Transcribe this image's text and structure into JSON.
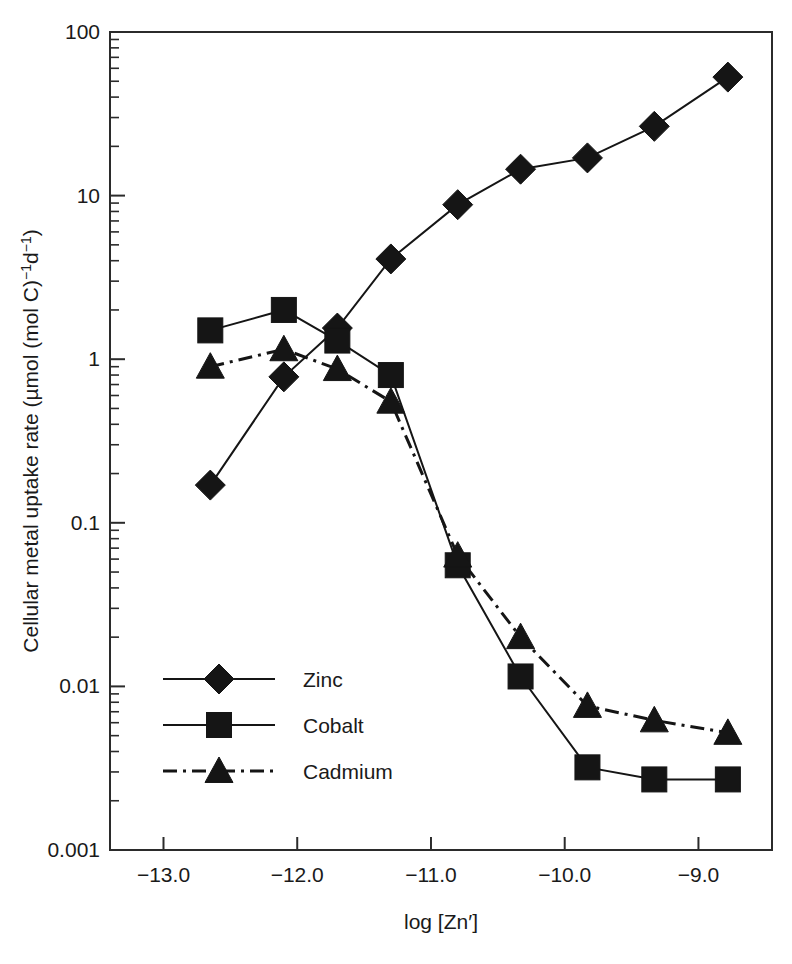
{
  "chart_data": {
    "type": "line",
    "title": "",
    "xlabel": "log [Zn′]",
    "ylabel": "Cellular metal uptake rate (µmol (mol C)⁻¹d⁻¹)",
    "ylabel_parts": {
      "main": "Cellular metal uptake rate (µmol (mol C)",
      "exp1": "−1",
      "mid": "d",
      "exp2": "−1",
      "close": ")"
    },
    "xlim": [
      -13.4,
      -8.45
    ],
    "ylim": [
      0.001,
      100
    ],
    "yscale": "log",
    "xscale": "linear",
    "grid": false,
    "legend_position": "lower-left-inside",
    "x_tick_labels": [
      "-13.0",
      "-12.0",
      "-11.0",
      "-10.0",
      "-9.0"
    ],
    "x_tick_values": [
      -13.0,
      -12.0,
      -11.0,
      -10.0,
      -9.0
    ],
    "y_tick_labels": [
      "100",
      "10",
      "1",
      "0.1",
      "0.01",
      "0.001"
    ],
    "y_tick_values": [
      100,
      10,
      1,
      0.1,
      0.01,
      0.001
    ],
    "series": [
      {
        "name": "Zinc",
        "marker": "diamond",
        "line_style": "solid",
        "color": "#151515",
        "x": [
          -12.65,
          -12.1,
          -11.7,
          -11.3,
          -10.8,
          -10.33,
          -9.83,
          -9.33,
          -8.78
        ],
        "y": [
          0.17,
          0.78,
          1.55,
          4.1,
          8.8,
          14.5,
          17.0,
          26.5,
          53.0
        ]
      },
      {
        "name": "Cobalt",
        "marker": "square",
        "line_style": "solid",
        "color": "#151515",
        "x": [
          -12.65,
          -12.1,
          -11.7,
          -11.3,
          -10.8,
          -10.33,
          -9.83,
          -9.33,
          -8.78
        ],
        "y": [
          1.5,
          2.0,
          1.3,
          0.8,
          0.055,
          0.0115,
          0.0032,
          0.0027,
          0.0027
        ]
      },
      {
        "name": "Cadmium",
        "marker": "triangle",
        "line_style": "dashdot",
        "color": "#151515",
        "x": [
          -12.65,
          -12.1,
          -11.7,
          -11.3,
          -10.8,
          -10.33,
          -9.83,
          -9.33,
          -8.78
        ],
        "y": [
          0.9,
          1.15,
          0.87,
          0.55,
          0.063,
          0.02,
          0.0076,
          0.0062,
          0.0052
        ]
      }
    ]
  },
  "legend": {
    "items": [
      {
        "label": "Zinc",
        "marker": "diamond",
        "line_style": "solid"
      },
      {
        "label": "Cobalt",
        "marker": "square",
        "line_style": "solid"
      },
      {
        "label": "Cadmium",
        "marker": "triangle",
        "line_style": "dashdot"
      }
    ]
  }
}
